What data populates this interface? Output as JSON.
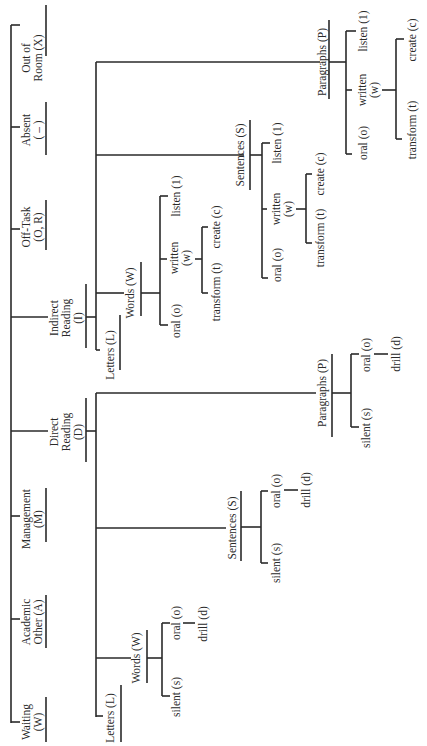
{
  "diagram": {
    "orientation": "rotated-90-ccw",
    "root_categories": [
      {
        "id": "out",
        "lines": [
          "Out of",
          "Room (X)"
        ]
      },
      {
        "id": "absent",
        "lines": [
          "Absent",
          "( – )"
        ]
      },
      {
        "id": "offtask",
        "lines": [
          "Off-Task",
          "(O, R)"
        ]
      },
      {
        "id": "indirect",
        "lines": [
          "Indirect",
          "Reading",
          "(I)"
        ]
      },
      {
        "id": "direct",
        "lines": [
          "Direct",
          "Reading",
          "(D)"
        ]
      },
      {
        "id": "management",
        "lines": [
          "Management",
          "(M)"
        ]
      },
      {
        "id": "academic",
        "lines": [
          "Academic",
          "Other (A)"
        ]
      },
      {
        "id": "waiting",
        "lines": [
          "Waiting",
          "(W)"
        ]
      }
    ],
    "indirect_reading": {
      "children": [
        "Letters (L)",
        "Words (W)",
        "Sentences (S)",
        "Paragraphs (P)"
      ],
      "sub_modes": {
        "listen": "listen (1)",
        "written": [
          "written",
          "(w)"
        ],
        "oral": "oral (o)",
        "create": "create (c)",
        "transform": "transform (t)"
      }
    },
    "direct_reading": {
      "children": [
        "Letters (L)",
        "Words (W)",
        "Sentences (S)",
        "Paragraphs (P)"
      ],
      "sub_modes": {
        "oral": "oral (o)",
        "drill": "drill (d)",
        "silent": "silent (s)"
      }
    }
  }
}
